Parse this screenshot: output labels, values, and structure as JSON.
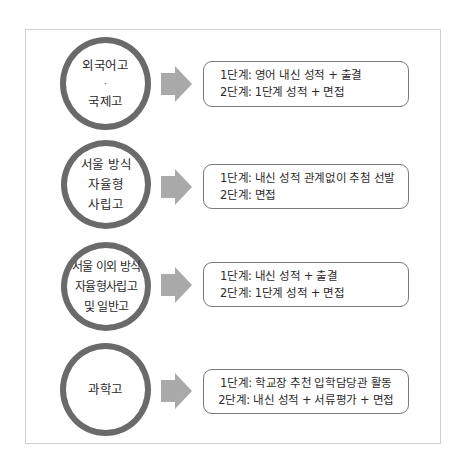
{
  "colors": {
    "circle_stroke": "#6a6a6a",
    "arrow_fill": "#a9a9a9",
    "box_border": "#7a7a7a",
    "frame_border": "#cfcfcf",
    "text": "#2a2a2a"
  },
  "rows": [
    {
      "school": {
        "lines": [
          "외국어고",
          "·",
          "국제고"
        ]
      },
      "icon": "right-arrow-icon",
      "steps": [
        "1단계: 영어 내신 성적 + 출결",
        "2단계: 1단계 성적 + 면접"
      ]
    },
    {
      "school": {
        "lines": [
          "서울 방식",
          "자율형",
          "사립고"
        ]
      },
      "icon": "right-arrow-icon",
      "steps": [
        "1단계: 내신 성적 관계없이 추첨 선발",
        "2단계: 면접"
      ]
    },
    {
      "school": {
        "lines": [
          "서울 이외 방식",
          "자율형사립고",
          "및 일반고"
        ]
      },
      "icon": "right-arrow-icon",
      "steps": [
        "1단계: 내신 성적 + 출결",
        "2단계: 1단계 성적 + 면접"
      ]
    },
    {
      "school": {
        "lines": [
          "과학고"
        ]
      },
      "icon": "right-arrow-icon",
      "steps": [
        "1단계: 학교장 추천 입학담당관 활동",
        "2단계: 내신 성적 + 서류평가 + 면접"
      ]
    }
  ]
}
